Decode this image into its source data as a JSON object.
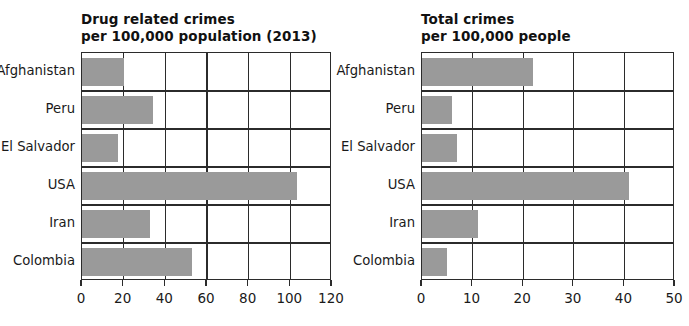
{
  "chart_data": [
    {
      "id": "drug-related-crimes",
      "type": "bar",
      "orientation": "horizontal",
      "title": "Drug related crimes",
      "subtitle": "per 100,000 population (2013)",
      "xlabel": "",
      "ylabel": "",
      "categories": [
        "Afghanistan",
        "Peru",
        "El Salvador",
        "USA",
        "Iran",
        "Colombia"
      ],
      "values": [
        20,
        34,
        17.5,
        103,
        32.5,
        53
      ],
      "xlim": [
        0,
        120
      ],
      "xticks": [
        0,
        20,
        40,
        60,
        80,
        100,
        120
      ],
      "xtick_labels": [
        "0",
        "20",
        "40",
        "60",
        "80",
        "100",
        "120"
      ],
      "grid": true,
      "legend": "none",
      "bar_color": "#9a9a9a",
      "axis_color": "#2b2b2b"
    },
    {
      "id": "total-crimes",
      "type": "bar",
      "orientation": "horizontal",
      "title": "Total crimes",
      "subtitle": "per 100,000 people",
      "xlabel": "",
      "ylabel": "",
      "categories": [
        "Afghanistan",
        "Peru",
        "El Salvador",
        "USA",
        "Iran",
        "Colombia"
      ],
      "values": [
        22,
        6,
        7,
        41,
        11,
        5
      ],
      "xlim": [
        0,
        50
      ],
      "xticks": [
        0,
        10,
        20,
        30,
        40,
        50
      ],
      "xtick_labels": [
        "0",
        "10",
        "20",
        "30",
        "40",
        "50"
      ],
      "grid": true,
      "legend": "none",
      "bar_color": "#9a9a9a",
      "axis_color": "#2b2b2b"
    }
  ]
}
